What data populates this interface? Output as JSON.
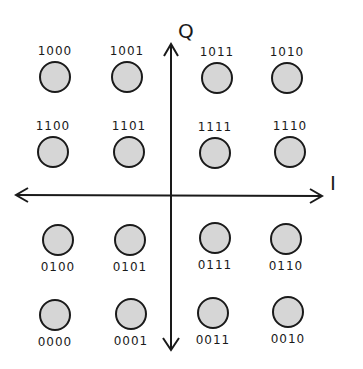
{
  "diagram": {
    "axes": {
      "vertical_label": "Q",
      "horizontal_label": "I",
      "stroke_color": "#1a1a1a"
    },
    "point_fill": "#d6d6d6",
    "point_stroke": "#1a1a1a",
    "points": [
      {
        "label": "1000",
        "cx": 55,
        "cy": 77,
        "label_pos": "above"
      },
      {
        "label": "1001",
        "cx": 127,
        "cy": 77,
        "label_pos": "above"
      },
      {
        "label": "1011",
        "cx": 217,
        "cy": 78,
        "label_pos": "above"
      },
      {
        "label": "1010",
        "cx": 287,
        "cy": 78,
        "label_pos": "above"
      },
      {
        "label": "1100",
        "cx": 53,
        "cy": 152,
        "label_pos": "above"
      },
      {
        "label": "1101",
        "cx": 129,
        "cy": 152,
        "label_pos": "above"
      },
      {
        "label": "1111",
        "cx": 215,
        "cy": 153,
        "label_pos": "above"
      },
      {
        "label": "1110",
        "cx": 290,
        "cy": 152,
        "label_pos": "above"
      },
      {
        "label": "0100",
        "cx": 58,
        "cy": 240,
        "label_pos": "below"
      },
      {
        "label": "0101",
        "cx": 130,
        "cy": 240,
        "label_pos": "below"
      },
      {
        "label": "0111",
        "cx": 215,
        "cy": 238,
        "label_pos": "below"
      },
      {
        "label": "0110",
        "cx": 286,
        "cy": 239,
        "label_pos": "below"
      },
      {
        "label": "0000",
        "cx": 55,
        "cy": 315,
        "label_pos": "below"
      },
      {
        "label": "0001",
        "cx": 131,
        "cy": 314,
        "label_pos": "below"
      },
      {
        "label": "0011",
        "cx": 213,
        "cy": 313,
        "label_pos": "below"
      },
      {
        "label": "0010",
        "cx": 288,
        "cy": 312,
        "label_pos": "below"
      }
    ]
  }
}
